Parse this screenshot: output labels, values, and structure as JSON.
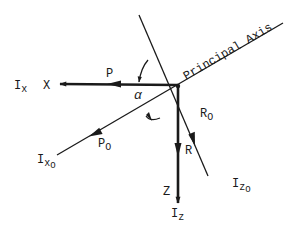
{
  "diagram": {
    "colors": {
      "ink": "#1a1a1a",
      "background": "#ffffff"
    },
    "labels": {
      "principal_axis": "Principal Axis",
      "x_axis": "X",
      "x_inertia_main": "I",
      "x_inertia_sub": "x",
      "p_force": "P",
      "alpha": "α",
      "r0_main": "R",
      "r0_sub": "O",
      "r_force": "R",
      "z_axis": "Z",
      "z_inertia_main": "I",
      "z_inertia_sub": "z",
      "p0_main": "P",
      "p0_sub": "O",
      "x0_inertia_main": "I",
      "x0_inertia_sub": "x",
      "x0_inertia_subsub": "O",
      "z0_inertia_main": "I",
      "z0_inertia_sub": "z",
      "z0_inertia_subsub": "O"
    }
  }
}
